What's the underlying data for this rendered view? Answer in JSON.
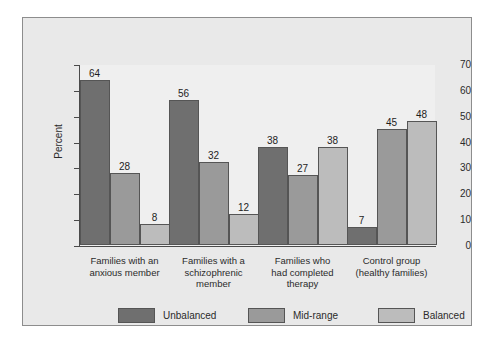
{
  "chart_data": {
    "type": "bar",
    "title": "",
    "xlabel": "",
    "ylabel": "Percent",
    "ylim": [
      0,
      70
    ],
    "yticks": [
      0,
      10,
      20,
      30,
      40,
      50,
      60,
      70
    ],
    "grid": false,
    "legend_position": "bottom",
    "categories": [
      "Families with an anxious member",
      "Families with a schizophrenic member",
      "Families who had completed therapy",
      "Control group (healthy families)"
    ],
    "category_lines": [
      [
        "Families with an",
        "anxious member"
      ],
      [
        "Families with a",
        "schizophrenic",
        "member"
      ],
      [
        "Families who",
        "had completed",
        "therapy"
      ],
      [
        "Control group",
        "(healthy families)"
      ]
    ],
    "series": [
      {
        "name": "Unbalanced",
        "color": "#6f6f6f",
        "values": [
          64,
          56,
          38,
          7
        ]
      },
      {
        "name": "Mid-range",
        "color": "#9a9a9a",
        "values": [
          28,
          32,
          27,
          45
        ]
      },
      {
        "name": "Balanced",
        "color": "#bcbcbc",
        "values": [
          8,
          12,
          38,
          48
        ]
      }
    ]
  },
  "colors": {
    "page_background": "#ffffff",
    "panel_background": "#e9e9e9",
    "plot_background": "#efefef",
    "panel_border": "#8d8d8d",
    "axis": "#4a4a4a",
    "bar_outline": "#555555",
    "text": "#2b2b2b"
  }
}
